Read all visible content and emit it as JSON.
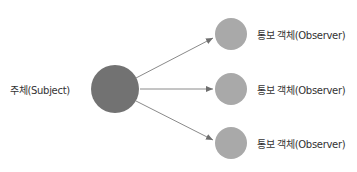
{
  "diagram": {
    "subject": {
      "label": "주체(Subject)",
      "color": "#727272"
    },
    "observers": [
      {
        "label": "통보 객체(Observer)",
        "color": "#a9a9a9"
      },
      {
        "label": "통보 객체(Observer)",
        "color": "#a9a9a9"
      },
      {
        "label": "통보 객체(Observer)",
        "color": "#a9a9a9"
      }
    ],
    "arrow_color": "#8a8a8a"
  }
}
